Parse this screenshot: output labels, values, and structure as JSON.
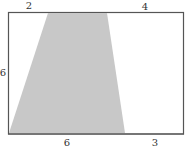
{
  "figure": {
    "type": "rectangle-with-shaded-trapezoid",
    "labels": {
      "top_left": "2",
      "top_right": "4",
      "left": "6",
      "bottom_left": "6",
      "bottom_right": "3"
    },
    "colors": {
      "border": "#555555",
      "shade": "#c8c8c8",
      "background": "#ffffff"
    }
  }
}
